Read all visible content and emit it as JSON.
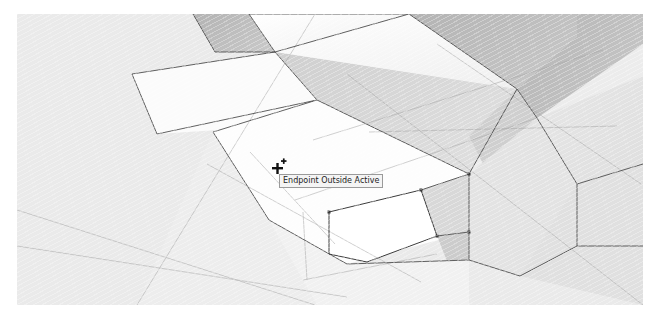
{
  "app": {
    "kind": "3d-modeling-viewport",
    "background_color": "#ececec",
    "page_background": "#ffffff"
  },
  "viewport": {
    "name": "modeling-viewport",
    "model_description": "Monochrome shaded staircase with construction guide lines",
    "shading": {
      "face_top_light": "#fdfdfd",
      "face_top_soft": "#f3f3f3",
      "face_riser_mid": "#d7d7d7",
      "face_riser_dark": "#b9b9b9",
      "face_highlight_active": "#ffffff",
      "edge_color": "#4a4a4a",
      "guide_line_color": "#9b9b9b",
      "background": "#ececec"
    }
  },
  "inference": {
    "tooltip_text": "Endpoint Outside Active",
    "tooltip_background": "#f4f4f4",
    "tooltip_border": "#9a9a9a",
    "tooltip_text_color": "#1c1c1c",
    "cursor_type": "line-tool-crosshair-cursor",
    "cursor_color": "#111111"
  }
}
